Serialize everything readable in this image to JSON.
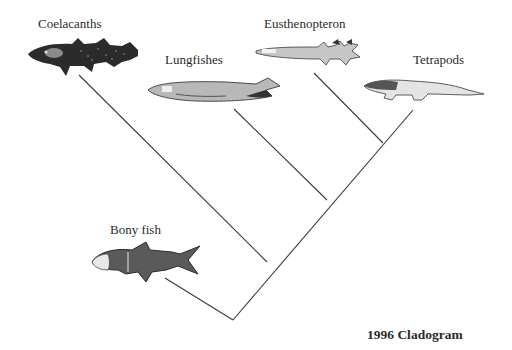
{
  "diagram": {
    "type": "cladogram",
    "caption": "1996 Cladogram",
    "taxa": [
      {
        "id": "coelacanths",
        "label": "Coelacanths",
        "icon": "coelacanth-illustration"
      },
      {
        "id": "lungfishes",
        "label": "Lungfishes",
        "icon": "lungfish-illustration"
      },
      {
        "id": "eusthenopteron",
        "label": "Eusthenopteron",
        "icon": "eusthenopteron-illustration"
      },
      {
        "id": "tetrapods",
        "label": "Tetrapods",
        "icon": "tetrapod-illustration"
      },
      {
        "id": "bony-fish",
        "label": "Bony fish",
        "icon": "bony-fish-illustration"
      }
    ],
    "topology": "(Bony fish, (Coelacanths, (Lungfishes, (Eusthenopteron, Tetrapods))))",
    "colors": {
      "line": "#3a3a3a",
      "text": "#2a2a2a",
      "background": "#ffffff"
    }
  }
}
